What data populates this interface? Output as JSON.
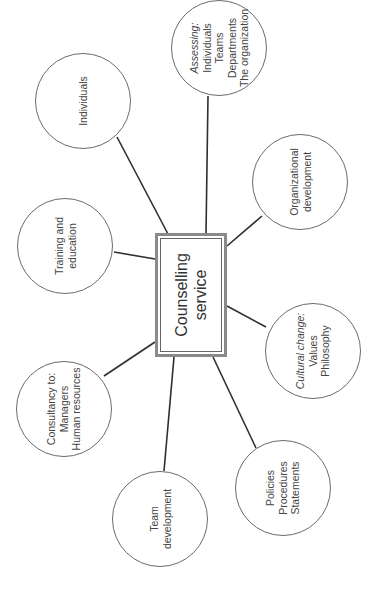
{
  "diagram": {
    "type": "hub-and-spoke",
    "orientation": "rotated -90deg",
    "line_color": "#2f2f2f",
    "circle_border_color": "#6a6a6a",
    "center": {
      "lines": [
        "Counselling",
        "service"
      ]
    },
    "nodes": [
      {
        "id": "assessing",
        "lines": [
          "Assessing:",
          "Individuals",
          "Teams",
          "Departments",
          "The organization"
        ],
        "italic_first": true
      },
      {
        "id": "individuals",
        "lines": [
          "Individuals"
        ]
      },
      {
        "id": "organizational",
        "lines": [
          "Organizational",
          "development"
        ]
      },
      {
        "id": "training",
        "lines": [
          "Training and",
          "education"
        ]
      },
      {
        "id": "cultural",
        "lines": [
          "Cultural change:",
          "Values",
          "Philosophy"
        ],
        "italic_first": true
      },
      {
        "id": "consultancy",
        "lines": [
          "Consultancy to:",
          "Managers",
          "Human resources"
        ]
      },
      {
        "id": "policies",
        "lines": [
          "Policies",
          "Procedures",
          "Statements"
        ]
      },
      {
        "id": "team",
        "lines": [
          "Team",
          "development"
        ]
      }
    ]
  }
}
